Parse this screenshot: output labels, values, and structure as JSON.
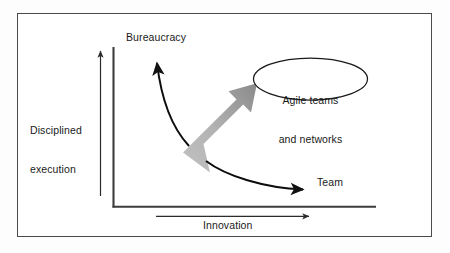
{
  "diagram": {
    "frame": {
      "border_color": "#4a4a4a",
      "background": "#ffffff"
    },
    "axes": {
      "y_axis": {
        "label_line1": "Disciplined",
        "label_line2": "execution",
        "direction_arrow": "up-arrow-icon",
        "color": "#333333"
      },
      "x_axis": {
        "label": "Innovation",
        "direction_arrow": "right-arrow-icon",
        "color": "#333333"
      }
    },
    "nodes": [
      {
        "id": "bureaucracy",
        "label": "Bureaucracy"
      },
      {
        "id": "team",
        "label": "Team"
      },
      {
        "id": "agile",
        "label_line1": "Agile teams",
        "label_line2": "and networks",
        "shape": "ellipse"
      }
    ],
    "connectors": [
      {
        "id": "curve-to-bureaucracy",
        "from": "transition",
        "to": "bureaucracy",
        "style": "curved-arrow-icon"
      },
      {
        "id": "curve-to-team",
        "from": "transition",
        "to": "team",
        "style": "curved-arrow-icon"
      }
    ],
    "transition_arrow": {
      "id": "big-block-arrow",
      "direction": "up-right",
      "gradient_from": "#b9b9b9",
      "gradient_to": "#8f8f8f"
    }
  }
}
